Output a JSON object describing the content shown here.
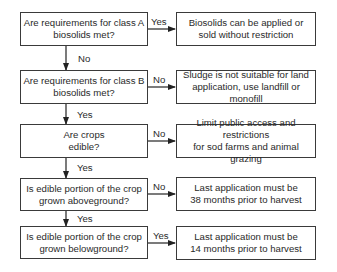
{
  "flowchart": {
    "decisions": [
      {
        "text": "Are requirements for class A biosolids met?",
        "line1": "Are requirements for class A",
        "line2": "biosolids met?"
      },
      {
        "text": "Are requirements for class B biosolids met?",
        "line1": "Are requirements for class B",
        "line2": "biosolids met?"
      },
      {
        "text": "Are crops edible?",
        "line1": "Are crops",
        "line2": "edible?"
      },
      {
        "text": "Is edible portion of the crop grown aboveground?",
        "line1": "Is edible portion of the crop",
        "line2": "grown aboveground?"
      },
      {
        "text": "Is edible portion of the crop grown belowground?",
        "line1": "Is edible portion of the crop",
        "line2": "grown belowground?"
      }
    ],
    "outcomes": [
      {
        "line1": "Biosolids can be applied or",
        "line2": "sold without restriction"
      },
      {
        "line1": "Sludge is not suitable for land",
        "line2": "application, use landfill or monofill"
      },
      {
        "line1": "Limit public access and restrictions",
        "line2": "for sod farms and animal grazing"
      },
      {
        "line1": "Last application must be",
        "line2": "38 months prior to harvest"
      },
      {
        "line1": "Last application must be",
        "line2": "14 months prior to harvest"
      }
    ],
    "side_labels": [
      "Yes",
      "No",
      "No",
      "No",
      "Yes"
    ],
    "down_labels": [
      "No",
      "Yes",
      "Yes",
      "Yes"
    ]
  }
}
